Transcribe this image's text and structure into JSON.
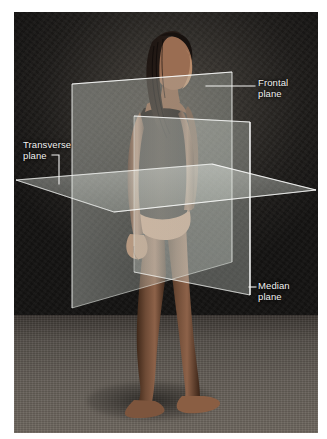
{
  "figure": {
    "subject_description": "Woman standing in anatomical position wearing a dark leotard, photographed against a dark studio backdrop",
    "background_colors": {
      "wall_dark": "#1e1c1a",
      "wall_light": "#4a443e",
      "floor": "#635d56",
      "border": "#ffffff"
    },
    "plane_color": "#cfd6cf",
    "leader_color": "#f2f2f0"
  },
  "labels": {
    "frontal": {
      "text": "Frontal\nplane",
      "name": "Frontal plane"
    },
    "median": {
      "text": "Median\nplane",
      "name": "Median plane"
    },
    "transverse": {
      "text": "Transverse\nplane",
      "name": "Transverse plane"
    }
  },
  "planes": [
    {
      "id": "frontal",
      "label": "Frontal plane",
      "orientation": "vertical-coronal"
    },
    {
      "id": "median",
      "label": "Median plane",
      "orientation": "vertical-sagittal"
    },
    {
      "id": "transverse",
      "label": "Transverse plane",
      "orientation": "horizontal-axial"
    }
  ]
}
